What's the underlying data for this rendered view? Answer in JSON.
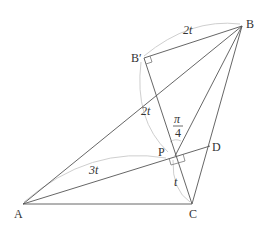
{
  "diagram": {
    "type": "geometry",
    "points": {
      "A": {
        "label": "A",
        "x": 23,
        "y": 204
      },
      "B": {
        "label": "B",
        "x": 242,
        "y": 26
      },
      "C": {
        "label": "C",
        "x": 192,
        "y": 204
      },
      "D": {
        "label": "D",
        "x": 210,
        "y": 146
      },
      "Bp": {
        "label": "B′",
        "x": 144,
        "y": 58
      },
      "P": {
        "label": "P",
        "x": 175,
        "y": 156
      }
    },
    "segments": [
      [
        "A",
        "B"
      ],
      [
        "A",
        "C"
      ],
      [
        "B",
        "C"
      ],
      [
        "A",
        "D"
      ],
      [
        "B",
        "P"
      ],
      [
        "Bp",
        "C"
      ],
      [
        "Bp",
        "B"
      ]
    ],
    "measurements": {
      "BpB": "2t",
      "BpP": "2t",
      "AP": "3t",
      "PC": "t",
      "angle_num": "π",
      "angle_den": "4"
    },
    "colors": {
      "line": "#555555",
      "arc": "#c8c8c8",
      "text": "#333333"
    }
  }
}
